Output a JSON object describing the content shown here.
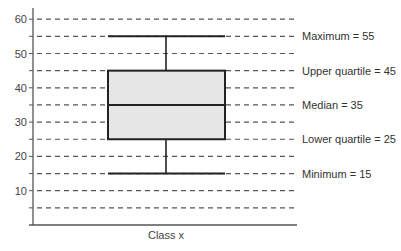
{
  "chart_data": {
    "type": "box",
    "title": "",
    "xlabel": "Class x",
    "ylabel": "",
    "categories": [
      "Class x"
    ],
    "series": [
      {
        "name": "Class x",
        "minimum": 15,
        "lower_quartile": 25,
        "median": 35,
        "upper_quartile": 45,
        "maximum": 55
      }
    ],
    "ylim": [
      0,
      62
    ],
    "y_ticks": [
      10,
      20,
      30,
      40,
      50,
      60
    ],
    "y_tick_labels": [
      "10",
      "20",
      "30",
      "40",
      "50",
      "60"
    ],
    "grid": {
      "on": true,
      "style": "dashed",
      "values": [
        5,
        10,
        15,
        20,
        25,
        30,
        35,
        40,
        45,
        50,
        55,
        60
      ]
    },
    "annotations": [
      {
        "value": 55,
        "text": "Maximum = 55"
      },
      {
        "value": 45,
        "text": "Upper quartile = 45"
      },
      {
        "value": 35,
        "text": "Median = 35"
      },
      {
        "value": 25,
        "text": "Lower quartile = 25"
      },
      {
        "value": 15,
        "text": "Minimum = 15"
      }
    ],
    "colors": {
      "box_fill": "#e6e6e6",
      "line": "#222222",
      "grid": "#555555",
      "axis": "#555555"
    }
  }
}
